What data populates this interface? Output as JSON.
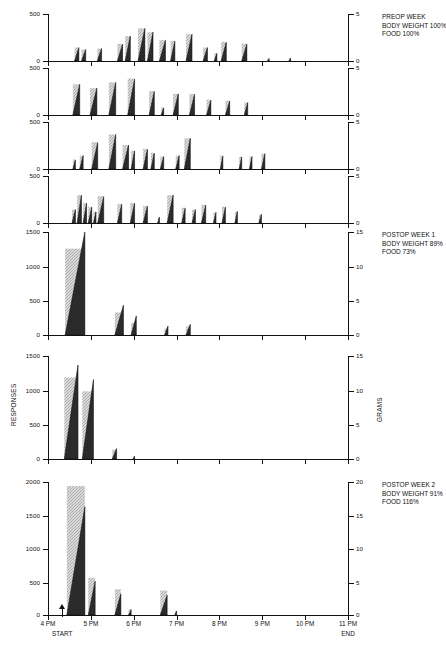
{
  "figure": {
    "axis_titles": {
      "left": "RESPONSES",
      "right": "GRAMS"
    },
    "x_axis": {
      "ticks": [
        "4 PM",
        "5 PM",
        "6 PM",
        "7 PM",
        "8 PM",
        "9 PM",
        "10 PM",
        "11 PM"
      ],
      "start_label": "START",
      "end_label": "END",
      "start_time_hours": 4.33,
      "range_hours": [
        4,
        11
      ]
    },
    "annotations": [
      {
        "panel": 0,
        "lines": [
          "PREOP WEEK",
          "BODY WEIGHT 100%",
          "FOOD 100%"
        ]
      },
      {
        "panel": 4,
        "lines": [
          "POSTOP WEEK 1",
          "BODY WEIGHT 89%",
          "FOOD 73%"
        ]
      },
      {
        "panel": 6,
        "lines": [
          "POSTOP WEEK 2",
          "BODY WEIGHT 91%",
          "FOOD 116%"
        ]
      }
    ]
  },
  "chart_data": {
    "type": "line",
    "xlabel": "Time of day",
    "ylabel": "RESPONSES",
    "ylabel_right": "GRAMS",
    "xlim": [
      4,
      11
    ],
    "panels": [
      {
        "name": "preop-day-1",
        "ylim": [
          0,
          500
        ],
        "yticks": [
          0,
          500
        ],
        "ylim_right": [
          0,
          5
        ],
        "yticks_right": [
          0,
          5
        ],
        "meals": [
          {
            "start": 4.62,
            "end": 4.72,
            "responses": 150,
            "grams": 1.5
          },
          {
            "start": 4.78,
            "end": 4.88,
            "responses": 130,
            "grams": 1.3
          },
          {
            "start": 5.15,
            "end": 5.25,
            "responses": 140,
            "grams": 1.4
          },
          {
            "start": 5.62,
            "end": 5.74,
            "responses": 185,
            "grams": 1.9
          },
          {
            "start": 5.8,
            "end": 5.92,
            "responses": 270,
            "grams": 2.7
          },
          {
            "start": 6.1,
            "end": 6.26,
            "responses": 350,
            "grams": 3.5
          },
          {
            "start": 6.32,
            "end": 6.45,
            "responses": 310,
            "grams": 3.1
          },
          {
            "start": 6.6,
            "end": 6.74,
            "responses": 225,
            "grams": 2.3
          },
          {
            "start": 6.86,
            "end": 6.96,
            "responses": 215,
            "grams": 2.2
          },
          {
            "start": 7.22,
            "end": 7.36,
            "responses": 290,
            "grams": 2.9
          },
          {
            "start": 7.62,
            "end": 7.72,
            "responses": 150,
            "grams": 1.5
          },
          {
            "start": 7.88,
            "end": 7.94,
            "responses": 90,
            "grams": 0.9
          },
          {
            "start": 8.04,
            "end": 8.16,
            "responses": 205,
            "grams": 2.1
          },
          {
            "start": 8.52,
            "end": 8.64,
            "responses": 185,
            "grams": 1.9
          },
          {
            "start": 9.12,
            "end": 9.16,
            "responses": 35,
            "grams": 0.4
          },
          {
            "start": 9.62,
            "end": 9.66,
            "responses": 40,
            "grams": 0.4
          }
        ]
      },
      {
        "name": "preop-day-2",
        "ylim": [
          0,
          500
        ],
        "yticks": [
          0,
          500
        ],
        "ylim_right": [
          0,
          5
        ],
        "yticks_right": [
          0,
          5
        ],
        "meals": [
          {
            "start": 4.58,
            "end": 4.74,
            "responses": 330,
            "grams": 3.3
          },
          {
            "start": 4.98,
            "end": 5.14,
            "responses": 290,
            "grams": 2.9
          },
          {
            "start": 5.42,
            "end": 5.58,
            "responses": 350,
            "grams": 3.5
          },
          {
            "start": 5.86,
            "end": 6.02,
            "responses": 385,
            "grams": 3.9
          },
          {
            "start": 6.36,
            "end": 6.48,
            "responses": 255,
            "grams": 2.6
          },
          {
            "start": 6.64,
            "end": 6.7,
            "responses": 85,
            "grams": 0.9
          },
          {
            "start": 6.92,
            "end": 7.04,
            "responses": 230,
            "grams": 2.3
          },
          {
            "start": 7.3,
            "end": 7.42,
            "responses": 225,
            "grams": 2.3
          },
          {
            "start": 7.7,
            "end": 7.8,
            "responses": 165,
            "grams": 1.7
          },
          {
            "start": 8.14,
            "end": 8.24,
            "responses": 155,
            "grams": 1.6
          },
          {
            "start": 8.58,
            "end": 8.66,
            "responses": 140,
            "grams": 1.4
          }
        ]
      },
      {
        "name": "preop-day-3",
        "ylim": [
          0,
          500
        ],
        "yticks": [
          0,
          500
        ],
        "ylim_right": [
          0,
          5
        ],
        "yticks_right": [
          0,
          5
        ],
        "meals": [
          {
            "start": 4.58,
            "end": 4.64,
            "responses": 105,
            "grams": 1.1
          },
          {
            "start": 4.74,
            "end": 4.82,
            "responses": 150,
            "grams": 1.5
          },
          {
            "start": 5.02,
            "end": 5.16,
            "responses": 285,
            "grams": 2.9
          },
          {
            "start": 5.42,
            "end": 5.58,
            "responses": 370,
            "grams": 3.7
          },
          {
            "start": 5.74,
            "end": 5.88,
            "responses": 260,
            "grams": 2.6
          },
          {
            "start": 5.94,
            "end": 6.02,
            "responses": 200,
            "grams": 2.0
          },
          {
            "start": 6.22,
            "end": 6.32,
            "responses": 215,
            "grams": 2.2
          },
          {
            "start": 6.4,
            "end": 6.48,
            "responses": 175,
            "grams": 1.8
          },
          {
            "start": 6.62,
            "end": 6.7,
            "responses": 140,
            "grams": 1.4
          },
          {
            "start": 6.98,
            "end": 7.06,
            "responses": 150,
            "grams": 1.5
          },
          {
            "start": 7.18,
            "end": 7.32,
            "responses": 330,
            "grams": 3.3
          },
          {
            "start": 8.02,
            "end": 8.08,
            "responses": 145,
            "grams": 1.5
          },
          {
            "start": 8.46,
            "end": 8.52,
            "responses": 135,
            "grams": 1.4
          },
          {
            "start": 8.7,
            "end": 8.76,
            "responses": 140,
            "grams": 1.4
          },
          {
            "start": 8.98,
            "end": 9.06,
            "responses": 170,
            "grams": 1.7
          }
        ]
      },
      {
        "name": "preop-day-4",
        "ylim": [
          0,
          500
        ],
        "yticks": [
          0,
          500
        ],
        "ylim_right": [
          0,
          5
        ],
        "yticks_right": [
          0,
          5
        ],
        "meals": [
          {
            "start": 4.56,
            "end": 4.64,
            "responses": 150,
            "grams": 1.5
          },
          {
            "start": 4.68,
            "end": 4.78,
            "responses": 300,
            "grams": 3.0
          },
          {
            "start": 4.82,
            "end": 4.9,
            "responses": 215,
            "grams": 2.2
          },
          {
            "start": 4.94,
            "end": 5.02,
            "responses": 175,
            "grams": 1.8
          },
          {
            "start": 5.06,
            "end": 5.12,
            "responses": 125,
            "grams": 1.3
          },
          {
            "start": 5.16,
            "end": 5.3,
            "responses": 285,
            "grams": 2.9
          },
          {
            "start": 5.62,
            "end": 5.72,
            "responses": 205,
            "grams": 2.1
          },
          {
            "start": 5.92,
            "end": 6.02,
            "responses": 215,
            "grams": 2.2
          },
          {
            "start": 6.22,
            "end": 6.32,
            "responses": 185,
            "grams": 1.9
          },
          {
            "start": 6.56,
            "end": 6.6,
            "responses": 70,
            "grams": 0.7
          },
          {
            "start": 6.78,
            "end": 6.92,
            "responses": 300,
            "grams": 3.0
          },
          {
            "start": 7.12,
            "end": 7.2,
            "responses": 165,
            "grams": 1.7
          },
          {
            "start": 7.36,
            "end": 7.44,
            "responses": 150,
            "grams": 1.5
          },
          {
            "start": 7.58,
            "end": 7.68,
            "responses": 195,
            "grams": 2.0
          },
          {
            "start": 7.86,
            "end": 7.92,
            "responses": 120,
            "grams": 1.2
          },
          {
            "start": 8.06,
            "end": 8.14,
            "responses": 175,
            "grams": 1.8
          },
          {
            "start": 8.36,
            "end": 8.42,
            "responses": 130,
            "grams": 1.3
          },
          {
            "start": 8.92,
            "end": 8.98,
            "responses": 100,
            "grams": 1.0
          }
        ]
      },
      {
        "name": "postop-week-1-day-1",
        "ylim": [
          0,
          1500
        ],
        "yticks": [
          0,
          500,
          1000,
          1500
        ],
        "ylim_right": [
          0,
          15
        ],
        "yticks_right": [
          0,
          5,
          10,
          15
        ],
        "meals": [
          {
            "start": 4.4,
            "end": 4.86,
            "responses": 1560,
            "grams": 12.6
          },
          {
            "start": 5.56,
            "end": 5.76,
            "responses": 445,
            "grams": 3.4
          },
          {
            "start": 5.94,
            "end": 6.06,
            "responses": 290,
            "grams": 1.9
          },
          {
            "start": 6.72,
            "end": 6.8,
            "responses": 145,
            "grams": 1.1
          },
          {
            "start": 7.22,
            "end": 7.32,
            "responses": 170,
            "grams": 1.4
          }
        ]
      },
      {
        "name": "postop-week-1-day-2",
        "ylim": [
          0,
          1500
        ],
        "yticks": [
          0,
          500,
          1000,
          1500
        ],
        "ylim_right": [
          0,
          15
        ],
        "yticks_right": [
          0,
          5,
          10,
          15
        ],
        "meals": [
          {
            "start": 4.38,
            "end": 4.7,
            "responses": 1370,
            "grams": 11.9
          },
          {
            "start": 4.8,
            "end": 5.06,
            "responses": 1160,
            "grams": 9.9
          },
          {
            "start": 5.5,
            "end": 5.6,
            "responses": 165,
            "grams": 1.5
          },
          {
            "start": 5.98,
            "end": 6.02,
            "responses": 55,
            "grams": 0.5
          }
        ]
      },
      {
        "name": "postop-week-2",
        "ylim": [
          0,
          2000
        ],
        "yticks": [
          0,
          500,
          1000,
          1500,
          2000
        ],
        "ylim_right": [
          0,
          20
        ],
        "yticks_right": [
          0,
          5,
          10,
          15,
          20
        ],
        "meals": [
          {
            "start": 4.44,
            "end": 4.86,
            "responses": 1630,
            "grams": 19.4
          },
          {
            "start": 4.94,
            "end": 5.1,
            "responses": 520,
            "grams": 5.7
          },
          {
            "start": 5.56,
            "end": 5.7,
            "responses": 330,
            "grams": 4.0
          },
          {
            "start": 5.88,
            "end": 5.94,
            "responses": 95,
            "grams": 1.0
          },
          {
            "start": 6.62,
            "end": 6.78,
            "responses": 310,
            "grams": 3.8
          },
          {
            "start": 6.96,
            "end": 7.0,
            "responses": 70,
            "grams": 0.8
          }
        ]
      }
    ]
  }
}
